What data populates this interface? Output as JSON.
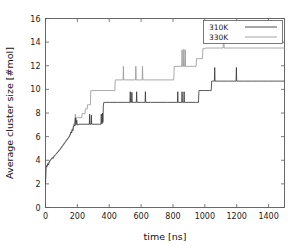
{
  "chart_data": {
    "type": "line",
    "title": "",
    "xlabel": "time [ns]",
    "ylabel": "Average cluster size [#mol]",
    "xlim": [
      0,
      1500
    ],
    "ylim": [
      0,
      16
    ],
    "xticks": [
      0,
      200,
      400,
      600,
      800,
      1000,
      1200,
      1400
    ],
    "yticks": [
      0,
      2,
      4,
      6,
      8,
      10,
      12,
      14,
      16
    ],
    "grid": false,
    "legend_position": "top-right",
    "series": [
      {
        "name": "310K",
        "color": "#3a3a3a",
        "points": [
          [
            0,
            2.0
          ],
          [
            3,
            3.3
          ],
          [
            6,
            3.5
          ],
          [
            10,
            3.45
          ],
          [
            14,
            3.7
          ],
          [
            18,
            3.6
          ],
          [
            24,
            3.85
          ],
          [
            30,
            4.0
          ],
          [
            36,
            4.05
          ],
          [
            42,
            4.2
          ],
          [
            48,
            4.15
          ],
          [
            55,
            4.35
          ],
          [
            62,
            4.45
          ],
          [
            70,
            4.55
          ],
          [
            78,
            4.7
          ],
          [
            86,
            4.8
          ],
          [
            94,
            4.95
          ],
          [
            102,
            5.1
          ],
          [
            110,
            5.25
          ],
          [
            118,
            5.4
          ],
          [
            126,
            5.55
          ],
          [
            134,
            5.7
          ],
          [
            142,
            5.85
          ],
          [
            150,
            6.0
          ],
          [
            156,
            6.2
          ],
          [
            160,
            6.4
          ],
          [
            164,
            6.3
          ],
          [
            168,
            6.6
          ],
          [
            172,
            6.5
          ],
          [
            176,
            6.8
          ],
          [
            180,
            7.0
          ],
          [
            184,
            6.9
          ],
          [
            188,
            7.6
          ],
          [
            190,
            7.0
          ],
          [
            193,
            7.0
          ],
          [
            196,
            7.4
          ],
          [
            199,
            7.0
          ],
          [
            205,
            7.0
          ],
          [
            210,
            7.05
          ],
          [
            230,
            7.05
          ],
          [
            260,
            7.05
          ],
          [
            275,
            7.05
          ],
          [
            277,
            7.9
          ],
          [
            279,
            7.05
          ],
          [
            286,
            7.05
          ],
          [
            288,
            7.8
          ],
          [
            290,
            7.05
          ],
          [
            310,
            7.05
          ],
          [
            340,
            7.05
          ],
          [
            348,
            7.05
          ],
          [
            350,
            7.9
          ],
          [
            352,
            7.1
          ],
          [
            356,
            7.1
          ],
          [
            358,
            8.0
          ],
          [
            360,
            7.2
          ],
          [
            363,
            8.6
          ],
          [
            366,
            8.9
          ],
          [
            370,
            8.9
          ],
          [
            400,
            8.9
          ],
          [
            450,
            8.9
          ],
          [
            500,
            8.9
          ],
          [
            530,
            8.9
          ],
          [
            532,
            9.8
          ],
          [
            534,
            8.9
          ],
          [
            540,
            8.9
          ],
          [
            542,
            9.75
          ],
          [
            544,
            8.9
          ],
          [
            560,
            8.9
          ],
          [
            570,
            8.9
          ],
          [
            572,
            9.8
          ],
          [
            574,
            8.9
          ],
          [
            600,
            8.9
          ],
          [
            625,
            8.9
          ],
          [
            627,
            9.8
          ],
          [
            629,
            8.9
          ],
          [
            660,
            8.9
          ],
          [
            700,
            8.9
          ],
          [
            760,
            8.9
          ],
          [
            800,
            8.9
          ],
          [
            828,
            8.9
          ],
          [
            830,
            9.8
          ],
          [
            832,
            8.9
          ],
          [
            855,
            8.9
          ],
          [
            857,
            9.8
          ],
          [
            859,
            8.9
          ],
          [
            868,
            8.9
          ],
          [
            870,
            9.8
          ],
          [
            872,
            8.9
          ],
          [
            900,
            8.9
          ],
          [
            940,
            8.9
          ],
          [
            960,
            8.9
          ],
          [
            963,
            9.9
          ],
          [
            966,
            9.9
          ],
          [
            1000,
            9.9
          ],
          [
            1030,
            9.9
          ],
          [
            1040,
            9.9
          ],
          [
            1043,
            10.7
          ],
          [
            1046,
            10.7
          ],
          [
            1060,
            10.7
          ],
          [
            1062,
            11.85
          ],
          [
            1064,
            10.7
          ],
          [
            1100,
            10.7
          ],
          [
            1150,
            10.7
          ],
          [
            1196,
            10.7
          ],
          [
            1198,
            11.85
          ],
          [
            1200,
            10.7
          ],
          [
            1250,
            10.7
          ],
          [
            1300,
            10.7
          ],
          [
            1400,
            10.7
          ],
          [
            1500,
            10.7
          ]
        ]
      },
      {
        "name": "330K",
        "color": "#9a9a9a",
        "points": [
          [
            0,
            2.0
          ],
          [
            3,
            3.4
          ],
          [
            6,
            3.55
          ],
          [
            10,
            3.5
          ],
          [
            14,
            3.75
          ],
          [
            18,
            3.7
          ],
          [
            24,
            3.9
          ],
          [
            30,
            4.05
          ],
          [
            36,
            4.1
          ],
          [
            42,
            4.25
          ],
          [
            48,
            4.2
          ],
          [
            55,
            4.4
          ],
          [
            62,
            4.5
          ],
          [
            70,
            4.6
          ],
          [
            78,
            4.75
          ],
          [
            86,
            4.9
          ],
          [
            94,
            5.0
          ],
          [
            102,
            5.2
          ],
          [
            110,
            5.3
          ],
          [
            118,
            5.5
          ],
          [
            126,
            5.6
          ],
          [
            134,
            5.8
          ],
          [
            142,
            5.9
          ],
          [
            150,
            6.1
          ],
          [
            158,
            6.3
          ],
          [
            164,
            6.5
          ],
          [
            170,
            6.7
          ],
          [
            176,
            6.9
          ],
          [
            180,
            7.1
          ],
          [
            184,
            7.3
          ],
          [
            188,
            7.9
          ],
          [
            192,
            7.4
          ],
          [
            196,
            7.6
          ],
          [
            200,
            7.6
          ],
          [
            215,
            7.6
          ],
          [
            228,
            7.6
          ],
          [
            230,
            7.95
          ],
          [
            234,
            7.95
          ],
          [
            248,
            7.95
          ],
          [
            250,
            8.35
          ],
          [
            254,
            8.35
          ],
          [
            262,
            8.35
          ],
          [
            264,
            8.7
          ],
          [
            268,
            8.7
          ],
          [
            282,
            8.7
          ],
          [
            284,
            9.9
          ],
          [
            288,
            9.9
          ],
          [
            330,
            9.9
          ],
          [
            380,
            9.9
          ],
          [
            420,
            9.9
          ],
          [
            435,
            9.9
          ],
          [
            438,
            10.8
          ],
          [
            442,
            10.8
          ],
          [
            480,
            10.8
          ],
          [
            487,
            10.8
          ],
          [
            489,
            11.95
          ],
          [
            491,
            10.8
          ],
          [
            560,
            10.8
          ],
          [
            565,
            10.8
          ],
          [
            567,
            11.95
          ],
          [
            569,
            10.8
          ],
          [
            600,
            10.8
          ],
          [
            607,
            10.8
          ],
          [
            609,
            11.95
          ],
          [
            611,
            10.8
          ],
          [
            640,
            10.8
          ],
          [
            700,
            10.8
          ],
          [
            760,
            10.8
          ],
          [
            800,
            10.8
          ],
          [
            805,
            10.8
          ],
          [
            808,
            11.95
          ],
          [
            812,
            11.95
          ],
          [
            855,
            11.95
          ],
          [
            857,
            13.35
          ],
          [
            859,
            11.95
          ],
          [
            866,
            11.95
          ],
          [
            868,
            13.4
          ],
          [
            870,
            11.95
          ],
          [
            875,
            11.95
          ],
          [
            877,
            13.35
          ],
          [
            879,
            11.95
          ],
          [
            930,
            11.95
          ],
          [
            945,
            11.95
          ],
          [
            948,
            12.6
          ],
          [
            952,
            12.6
          ],
          [
            985,
            12.6
          ],
          [
            988,
            13.45
          ],
          [
            992,
            13.45
          ],
          [
            1000,
            13.45
          ],
          [
            1003,
            13.45
          ],
          [
            1005,
            13.5
          ],
          [
            1040,
            13.5
          ],
          [
            1100,
            13.5
          ],
          [
            1115,
            13.5
          ],
          [
            1118,
            15.35
          ],
          [
            1121,
            13.5
          ],
          [
            1200,
            13.5
          ],
          [
            1300,
            13.5
          ],
          [
            1400,
            13.5
          ],
          [
            1500,
            13.5
          ]
        ]
      }
    ]
  },
  "legend": {
    "entries": [
      {
        "label": "310K"
      },
      {
        "label": "330K"
      }
    ]
  }
}
